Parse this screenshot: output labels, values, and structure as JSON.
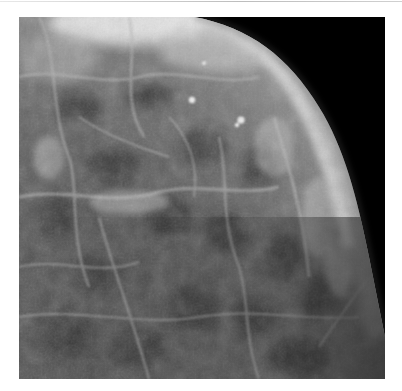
{
  "image": {
    "subject": "mammogram",
    "description": "Grayscale breast X-ray showing fibroglandular tissue against black background",
    "colors": {
      "background": "#000000",
      "tissue_dark": "#3a3a3a",
      "tissue_mid": "#6e6e6e",
      "tissue_bright": "#e6e6e6",
      "page": "#ffffff"
    }
  }
}
